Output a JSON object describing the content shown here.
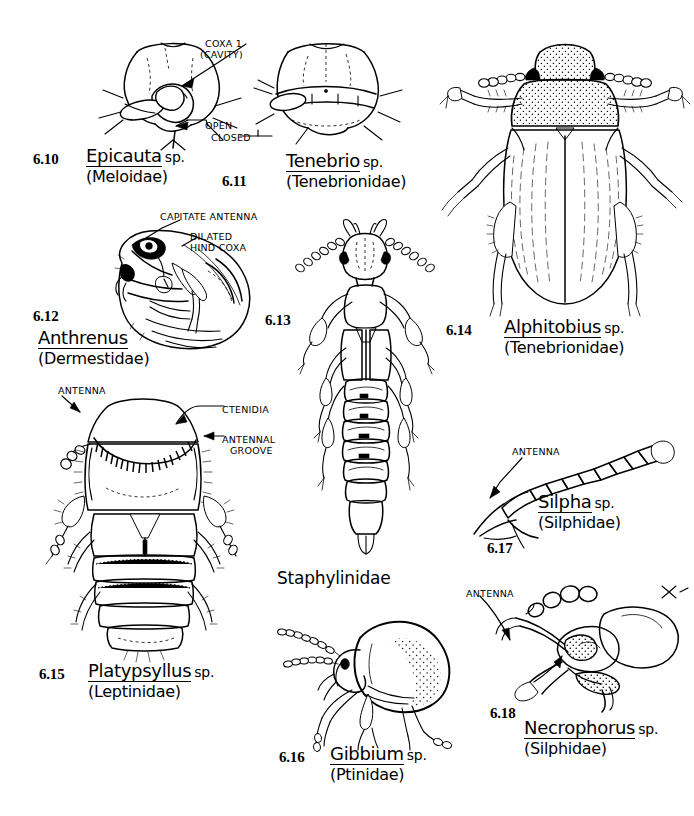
{
  "plate": {
    "title": "Coleoptera identification plate 6.10-6.18",
    "background": "#ffffff",
    "ink": "#000000"
  },
  "figures": [
    {
      "number": "6.10",
      "genus": "Epicauta",
      "sp": "sp.",
      "family": "(Meloidae)",
      "subject": "prothorax ventral view showing front coxal cavity",
      "annotations": [
        "COXA 1",
        "(CAVITY)",
        "OPEN",
        "CLOSED"
      ]
    },
    {
      "number": "6.11",
      "genus": "Tenebrio",
      "sp": "sp.",
      "family": "(Tenebrionidae)",
      "subject": "prothorax ventral view showing closed front coxal cavity",
      "annotations": []
    },
    {
      "number": "6.12",
      "genus": "Anthrenus",
      "sp": "",
      "family": "(Dermestidae)",
      "subject": "lateral habitus of carpet beetle",
      "annotations": [
        "CAPITATE ANTENNA",
        "DILATED",
        "HIND COXA"
      ]
    },
    {
      "number": "6.13",
      "genus": "",
      "sp": "",
      "family": "Staphylinidae",
      "subject": "dorsal habitus of rove beetle",
      "annotations": []
    },
    {
      "number": "6.14",
      "genus": "Alphitobius",
      "sp": "sp.",
      "family": "(Tenebrionidae)",
      "subject": "dorsal habitus of lesser mealworm beetle",
      "annotations": []
    },
    {
      "number": "6.15",
      "genus": "Platypsyllus",
      "sp": "sp.",
      "family": "(Leptinidae)",
      "subject": "dorsal habitus of beaver parasite beetle",
      "annotations": [
        "ANTENNA",
        "CTENIDIA",
        "ANTENNAL",
        "GROOVE"
      ]
    },
    {
      "number": "6.16",
      "genus": "Gibbium",
      "sp": "sp.",
      "family": "(Ptinidae)",
      "subject": "lateral habitus of humpback spider beetle",
      "annotations": []
    },
    {
      "number": "6.17",
      "genus": "Silpha",
      "sp": "sp.",
      "family": "(Silphidae)",
      "subject": "antenna detail, gradually clubbed",
      "annotations": [
        "ANTENNA"
      ]
    },
    {
      "number": "6.18",
      "genus": "Necrophorus",
      "sp": "sp.",
      "family": "(Silphidae)",
      "subject": "head lateral view with capitate antenna",
      "annotations": [
        "ANTENNA"
      ]
    }
  ],
  "labels": {
    "f610_num": "6.10",
    "f610_genus": "Epicauta",
    "f610_sp": "sp.",
    "f610_family": "(Meloidae)",
    "f610_coxa1": "COXA 1",
    "f610_cavity": "(CAVITY)",
    "f610_open": "OPEN",
    "f610_closed": "CLOSED",
    "f611_num": "6.11",
    "f611_genus": "Tenebrio",
    "f611_sp": "sp.",
    "f611_family": "(Tenebrionidae)",
    "f612_num": "6.12",
    "f612_genus": "Anthrenus",
    "f612_family": "(Dermestidae)",
    "f612_capitate": "CAPITATE ANTENNA",
    "f612_dilated": "DILATED",
    "f612_hindcoxa": "HIND COXA",
    "f613_num": "6.13",
    "f613_family": "Staphylinidae",
    "f614_num": "6.14",
    "f614_genus": "Alphitobius",
    "f614_sp": "sp.",
    "f614_family": "(Tenebrionidae)",
    "f615_num": "6.15",
    "f615_genus": "Platypsyllus",
    "f615_sp": "sp.",
    "f615_family": "(Leptinidae)",
    "f615_antenna": "ANTENNA",
    "f615_ctenidia": "CTENIDIA",
    "f615_antennal": "ANTENNAL",
    "f615_groove": "GROOVE",
    "f616_num": "6.16",
    "f616_genus": "Gibbium",
    "f616_sp": "sp.",
    "f616_family": "(Ptinidae)",
    "f617_num": "6.17",
    "f617_genus": "Silpha",
    "f617_sp": "sp.",
    "f617_family": "(Silphidae)",
    "f617_antenna": "ANTENNA",
    "f618_num": "6.18",
    "f618_genus": "Necrophorus",
    "f618_sp": "sp.",
    "f618_family": "(Silphidae)",
    "f618_antenna": "ANTENNA"
  }
}
